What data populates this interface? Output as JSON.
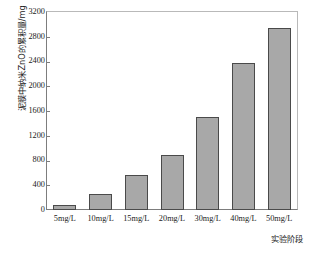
{
  "chart_data": {
    "type": "bar",
    "title": "",
    "subtitle": "",
    "categories": [
      "5mg/L",
      "10mg/L",
      "15mg/L",
      "20mg/L",
      "30mg/L",
      "40mg/L",
      "50mg/L"
    ],
    "values": [
      80,
      265,
      570,
      885,
      1500,
      2380,
      2940
    ],
    "xlabel": "实验阶段",
    "ylabel": "泥膜中纳米ZnO的累积量/mg",
    "ylim": [
      0,
      3200
    ],
    "yticks": [
      0,
      400,
      800,
      1200,
      1600,
      2000,
      2400,
      2800,
      3200
    ],
    "ytick_labels": [
      "0",
      "400",
      "800",
      "1200",
      "1600",
      "2000",
      "2400",
      "2800",
      "3200"
    ],
    "grid": false,
    "legend": null,
    "legend_position": "none",
    "bar_fill_color": "#a8a8a8",
    "bar_edge_color": "#4a4a4a",
    "axis_color": "#7d7d7d",
    "background_color": "#ffffff"
  }
}
